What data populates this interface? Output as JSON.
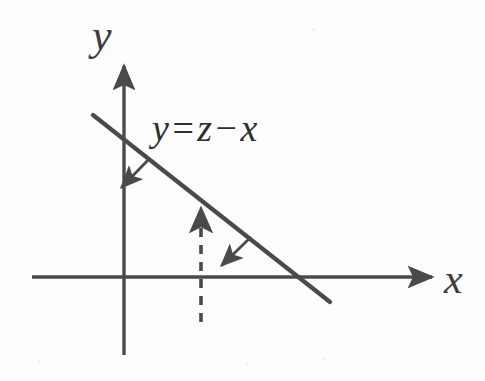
{
  "figure": {
    "background_color": "#fdfdfd",
    "stroke_color": "#4a4a4a",
    "text_color": "#2e2e2e"
  },
  "axes": {
    "x_label": "x",
    "y_label": "y",
    "x_axis": {
      "x1": 32,
      "y1": 277,
      "x2": 438,
      "y2": 277,
      "arrow": "right"
    },
    "y_axis": {
      "x1": 124,
      "y1": 355,
      "x2": 124,
      "y2": 60,
      "arrow": "up"
    },
    "origin": {
      "x": 124,
      "y": 277
    }
  },
  "equation": {
    "lhs": "y",
    "equals": "=",
    "rhs_first": "z",
    "minus": "−",
    "rhs_second": "x",
    "full_text": "y = z − x"
  },
  "line": {
    "label": "y = z - x",
    "x1": 93,
    "y1": 115,
    "x2": 330,
    "y2": 302,
    "y_intercept_px": {
      "x": 124,
      "y": 133
    },
    "x_intercept_px": {
      "x": 297,
      "y": 277
    },
    "slope": "negative",
    "style": "solid"
  },
  "dashed_line": {
    "x": 201,
    "y_top": 203,
    "y_bottom": 322,
    "style": "dashed",
    "arrow": "up",
    "dash_pattern": "9 8"
  },
  "gradient_arrows": [
    {
      "name": "upper-gradient-arrow",
      "x1": 150,
      "y1": 158,
      "x2": 118,
      "y2": 191,
      "direction": "down-left",
      "anchor": "line"
    },
    {
      "name": "lower-gradient-arrow",
      "x1": 251,
      "y1": 237,
      "x2": 218,
      "y2": 269,
      "direction": "down-left",
      "anchor": "line"
    }
  ],
  "speckles": [
    {
      "x": 38,
      "y": 360,
      "size": 3
    },
    {
      "x": 130,
      "y": 366,
      "size": 2
    },
    {
      "x": 246,
      "y": 362,
      "size": 3
    },
    {
      "x": 262,
      "y": 368,
      "size": 2
    },
    {
      "x": 322,
      "y": 358,
      "size": 3
    },
    {
      "x": 370,
      "y": 364,
      "size": 2
    },
    {
      "x": 430,
      "y": 370,
      "size": 2
    },
    {
      "x": 312,
      "y": 28,
      "size": 3
    },
    {
      "x": 404,
      "y": 44,
      "size": 2
    }
  ]
}
